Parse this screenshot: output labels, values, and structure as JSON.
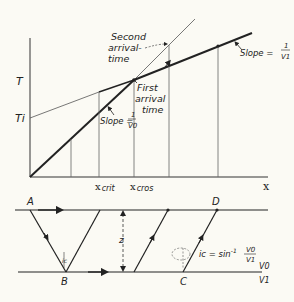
{
  "diagram": {
    "type": "seismic-refraction-traveltime",
    "colors": {
      "background": "#fbfaf4",
      "ink": "#222222"
    },
    "graph": {
      "y_axis_label": "T",
      "intercept_label": "Ti",
      "x_axis_label": "x",
      "x_crit_label": "x",
      "x_crit_sub": "crit",
      "x_cros_label": "x",
      "x_cros_sub": "cros",
      "second_arrival": [
        "Second",
        "arrival-",
        "time"
      ],
      "first_arrival": [
        "First",
        "arrival",
        "time"
      ],
      "slope_v0": {
        "prefix": "Slope =",
        "num": "1",
        "den": "V0"
      },
      "slope_v1": {
        "prefix": "Slope =",
        "num": "1",
        "den": "V1"
      }
    },
    "section": {
      "point_a": "A",
      "point_b": "B",
      "point_c": "C",
      "point_d": "D",
      "depth_label": "z",
      "angle_label": "ic",
      "critical_angle_formula": {
        "prefix": "ic = sin",
        "exp": "-1",
        "num": "V0",
        "den": "V1"
      },
      "upper_layer_velocity": "V0",
      "lower_layer_velocity": "V1"
    }
  }
}
